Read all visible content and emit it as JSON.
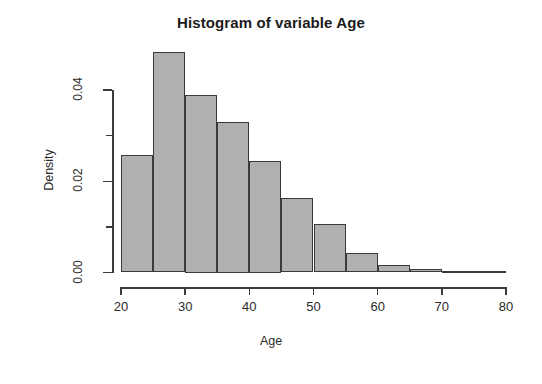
{
  "chart_data": {
    "type": "bar",
    "title": "Histogram of variable Age",
    "xlabel": "Age",
    "ylabel": "Density",
    "xlim": [
      20,
      80
    ],
    "ylim": [
      0.0,
      0.05
    ],
    "grid": false,
    "legend": null,
    "bin_width": 5,
    "bin_edges": [
      20,
      25,
      30,
      35,
      40,
      45,
      50,
      55,
      60,
      65,
      70,
      75,
      80
    ],
    "categories": [
      "20-25",
      "25-30",
      "30-35",
      "35-40",
      "40-45",
      "45-50",
      "50-55",
      "55-60",
      "60-65",
      "65-70",
      "70-75",
      "75-80"
    ],
    "values": [
      0.0258,
      0.0484,
      0.039,
      0.033,
      0.0245,
      0.0163,
      0.0106,
      0.0042,
      0.0016,
      0.0007,
      0.0002,
      0.0002
    ],
    "x_tick_labels": [
      "20",
      "30",
      "40",
      "50",
      "60",
      "70",
      "80"
    ],
    "x_tick_values": [
      20,
      30,
      40,
      50,
      60,
      70,
      80
    ],
    "y_tick_labels": [
      "0.00",
      "0.02",
      "0.04"
    ],
    "y_tick_values": [
      0.0,
      0.02,
      0.04
    ],
    "y_minor_tick_values": [
      0.01,
      0.03
    ],
    "bar_fill_color": "#b0b0b0",
    "bar_border_color": "#3a3a3a",
    "axis_color": "#3b3b3b",
    "background_color": "#ffffff"
  }
}
